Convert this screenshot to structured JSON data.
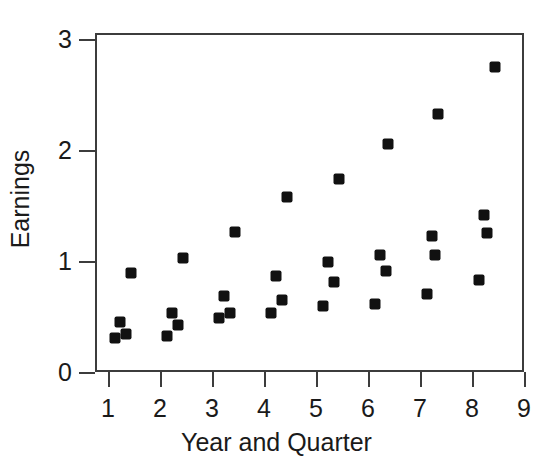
{
  "chart_data": {
    "type": "scatter",
    "title": "",
    "xlabel": "Year and Quarter",
    "ylabel": "Earnings",
    "xlim": [
      0.75,
      9.0
    ],
    "ylim": [
      0,
      3.05
    ],
    "xticks": [
      1,
      2,
      3,
      4,
      5,
      6,
      7,
      8,
      9
    ],
    "yticks": [
      0,
      1,
      2,
      3
    ],
    "xtick_labels": [
      "1",
      "2",
      "3",
      "4",
      "5",
      "6",
      "7",
      "8",
      "9"
    ],
    "ytick_labels": [
      "0",
      "1",
      "2",
      "3"
    ],
    "grid": false,
    "legend": null,
    "marker": {
      "shape": "square",
      "color": "#111111",
      "size": 11
    },
    "series": [
      {
        "name": "Earnings",
        "points": [
          {
            "x": 1.1,
            "y": 0.32
          },
          {
            "x": 1.2,
            "y": 0.47
          },
          {
            "x": 1.3,
            "y": 0.36
          },
          {
            "x": 1.4,
            "y": 0.91
          },
          {
            "x": 2.1,
            "y": 0.34
          },
          {
            "x": 2.2,
            "y": 0.55
          },
          {
            "x": 2.3,
            "y": 0.44
          },
          {
            "x": 2.4,
            "y": 1.04
          },
          {
            "x": 3.1,
            "y": 0.5
          },
          {
            "x": 3.2,
            "y": 0.7
          },
          {
            "x": 3.3,
            "y": 0.55
          },
          {
            "x": 3.4,
            "y": 1.28
          },
          {
            "x": 4.1,
            "y": 0.55
          },
          {
            "x": 4.2,
            "y": 0.88
          },
          {
            "x": 4.3,
            "y": 0.67
          },
          {
            "x": 4.4,
            "y": 1.59
          },
          {
            "x": 5.1,
            "y": 0.61
          },
          {
            "x": 5.2,
            "y": 1.01
          },
          {
            "x": 5.3,
            "y": 0.83
          },
          {
            "x": 5.4,
            "y": 1.75
          },
          {
            "x": 6.1,
            "y": 0.63
          },
          {
            "x": 6.2,
            "y": 1.07
          },
          {
            "x": 6.3,
            "y": 0.93
          },
          {
            "x": 6.35,
            "y": 2.07
          },
          {
            "x": 7.1,
            "y": 0.72
          },
          {
            "x": 7.2,
            "y": 1.24
          },
          {
            "x": 7.25,
            "y": 1.07
          },
          {
            "x": 7.3,
            "y": 2.34
          },
          {
            "x": 8.1,
            "y": 0.85
          },
          {
            "x": 8.2,
            "y": 1.43
          },
          {
            "x": 8.25,
            "y": 1.27
          },
          {
            "x": 8.4,
            "y": 2.76
          }
        ]
      }
    ]
  }
}
